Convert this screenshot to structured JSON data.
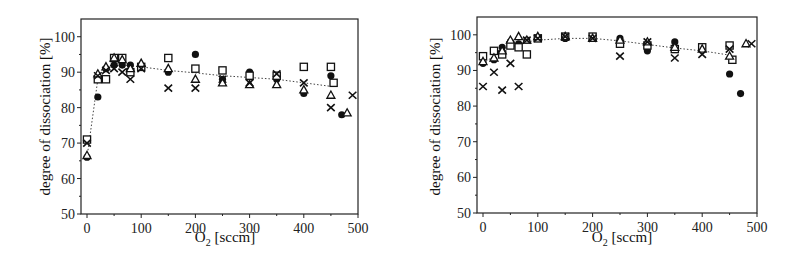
{
  "chart_data": [
    {
      "type": "scatter",
      "title": "",
      "xlabel": "O2 [sccm]",
      "ylabel": "degree of dissociation [%]",
      "xlim": [
        -5,
        500
      ],
      "ylim": [
        50,
        105
      ],
      "xticks": [
        0,
        100,
        200,
        300,
        400,
        500
      ],
      "yticks": [
        50,
        60,
        70,
        80,
        90,
        100
      ],
      "grid": false,
      "legend": "none",
      "series": [
        {
          "name": "filled-circle",
          "marker": "circle-filled",
          "x": [
            0,
            20,
            35,
            50,
            65,
            80,
            100,
            150,
            200,
            250,
            300,
            350,
            400,
            450,
            470
          ],
          "y": [
            66,
            83,
            91,
            92,
            92,
            92,
            91.5,
            90,
            95,
            88,
            90,
            88,
            84,
            89,
            78
          ]
        },
        {
          "name": "open-square",
          "marker": "square-open",
          "x": [
            0,
            20,
            35,
            50,
            65,
            80,
            100,
            150,
            200,
            250,
            300,
            350,
            400,
            450,
            455
          ],
          "y": [
            71,
            88,
            88,
            94,
            94,
            90,
            91.5,
            94,
            91,
            90.5,
            89,
            89,
            91.5,
            91.5,
            87
          ]
        },
        {
          "name": "open-triangle",
          "marker": "triangle-open",
          "x": [
            0,
            20,
            35,
            50,
            65,
            80,
            100,
            150,
            200,
            250,
            300,
            350,
            400,
            450,
            480
          ],
          "y": [
            66.5,
            89.5,
            91.5,
            94,
            93.5,
            91,
            92.5,
            91,
            88,
            87,
            86.5,
            86.5,
            85,
            83.5,
            78.5
          ]
        },
        {
          "name": "cross",
          "marker": "x",
          "x": [
            0,
            20,
            35,
            50,
            65,
            80,
            100,
            150,
            200,
            250,
            300,
            350,
            400,
            450,
            490
          ],
          "y": [
            70,
            89,
            90.5,
            91,
            90,
            88,
            91,
            85.5,
            85.5,
            88,
            87,
            89.5,
            87,
            80,
            83.5
          ]
        }
      ],
      "fit_line": {
        "style": "dotted",
        "x": [
          0,
          20,
          35,
          50,
          70,
          100,
          150,
          200,
          250,
          300,
          350,
          400,
          450
        ],
        "y": [
          66,
          88,
          90.5,
          92,
          92,
          91.5,
          90.5,
          89.8,
          89,
          88.5,
          88,
          87,
          86
        ]
      }
    },
    {
      "type": "scatter",
      "title": "",
      "xlabel": "O2 [sccm]",
      "ylabel": "degree of dissociation [%]",
      "xlim": [
        -5,
        500
      ],
      "ylim": [
        50,
        105
      ],
      "xticks": [
        0,
        100,
        200,
        300,
        400,
        500
      ],
      "yticks": [
        50,
        60,
        70,
        80,
        90,
        100
      ],
      "grid": false,
      "legend": "none",
      "series": [
        {
          "name": "filled-circle",
          "marker": "circle-filled",
          "x": [
            0,
            20,
            35,
            50,
            65,
            80,
            100,
            150,
            200,
            250,
            300,
            350,
            400,
            450,
            470
          ],
          "y": [
            92,
            93,
            96.5,
            98,
            97.5,
            98.5,
            99,
            99,
            99,
            99,
            95.5,
            98,
            96.5,
            89,
            83.5
          ]
        },
        {
          "name": "open-square",
          "marker": "square-open",
          "x": [
            0,
            20,
            35,
            50,
            65,
            80,
            100,
            150,
            200,
            250,
            300,
            350,
            400,
            450,
            455
          ],
          "y": [
            94,
            95.5,
            94.5,
            97,
            96.5,
            94.5,
            99,
            99.5,
            99.5,
            97.5,
            97,
            96,
            96.5,
            97,
            93
          ]
        },
        {
          "name": "open-triangle",
          "marker": "triangle-open",
          "x": [
            0,
            20,
            35,
            50,
            65,
            80,
            100,
            150,
            200,
            250,
            300,
            350,
            400,
            450,
            480
          ],
          "y": [
            92.5,
            93.5,
            95.5,
            98.5,
            99.5,
            98.5,
            99.5,
            99.5,
            99,
            98.5,
            98,
            96.5,
            96,
            94,
            97.5
          ]
        },
        {
          "name": "cross",
          "marker": "x",
          "x": [
            0,
            20,
            35,
            50,
            65,
            80,
            100,
            150,
            200,
            250,
            300,
            350,
            400,
            450,
            490
          ],
          "y": [
            85.5,
            89.5,
            84.5,
            92,
            85.5,
            98.5,
            99,
            99.5,
            99,
            94,
            98,
            93.5,
            94.5,
            96,
            97.5
          ]
        }
      ],
      "fit_line": {
        "style": "dotted",
        "x": [
          0,
          20,
          35,
          50,
          80,
          100,
          150,
          200,
          250,
          300,
          350,
          400,
          450
        ],
        "y": [
          92,
          94,
          95.5,
          96.5,
          98,
          98.5,
          99,
          99,
          98.3,
          97.3,
          96.3,
          95.5,
          94.3
        ]
      }
    }
  ],
  "panels": [
    {
      "ylabel": "degree of dissociation [%]",
      "xlabel_main": "O",
      "xlabel_sub": "2",
      "xlabel_unit": " [sccm]"
    },
    {
      "ylabel": "degree of dissociation [%]",
      "xlabel_main": "O",
      "xlabel_sub": "2",
      "xlabel_unit": " [sccm]"
    }
  ]
}
